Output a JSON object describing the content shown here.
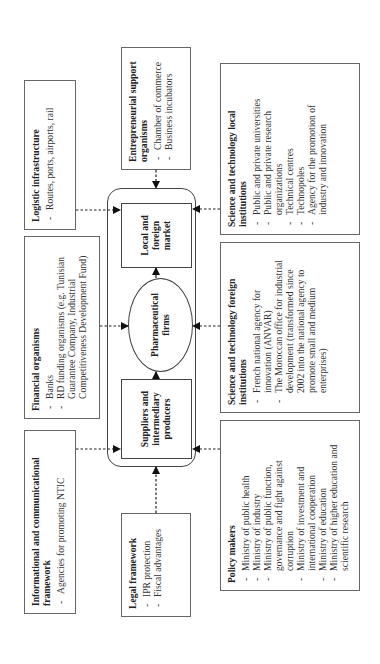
{
  "core": {
    "suppliers": "Suppliers and intermediary producers",
    "pharma": "Pharmaceutical firms",
    "market": "Local and foreign market"
  },
  "boxes": {
    "informational": {
      "title": "Informational and communicational framework",
      "items": [
        "Agencies for promoting NTIC"
      ]
    },
    "financial": {
      "title": "Financial organisms",
      "items": [
        "Banks",
        "RD funding organisms (e.g. Tunisian Guarantee Company, Industrial Competitiveness Development Fund)"
      ]
    },
    "logistic": {
      "title": "Logistic infrastructure",
      "items": [
        "Routes, ports, airports, rail"
      ]
    },
    "legal": {
      "title": "Legal framework",
      "items": [
        "IPR protection",
        "Fiscal advantages"
      ]
    },
    "entrepreneurial": {
      "title": "Entrepreneurial support organisms",
      "items": [
        "Chamber of commerce",
        "Business incubators"
      ]
    },
    "policy": {
      "title": "Policy makers",
      "items": [
        "Ministry of public health",
        "Ministry of industry",
        "Ministry of public function, governance and fight against corruption",
        "Ministry of investment and international cooperation",
        "Ministry of education",
        "Ministry of higher education and scientific research"
      ]
    },
    "sci_foreign": {
      "title": "Science and technology foreign institutions",
      "items": [
        "French national agency for innovation (ANVAR)",
        "The Moroccan office for industrial development (transformed since 2002 into the national agency to promote small and medium enterprises)"
      ]
    },
    "sci_local": {
      "title": "Science and technology local institutions",
      "items": [
        "Public and private universities",
        "Public and private research organizations",
        "Technical centres",
        "Technopoles",
        "Agency for the promotion of industry and innovation"
      ]
    }
  },
  "colors": {
    "line": "#444444",
    "arrow": "#111111",
    "border": "#666666"
  }
}
